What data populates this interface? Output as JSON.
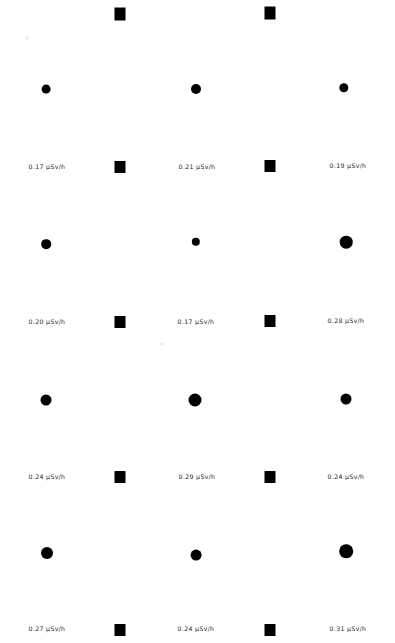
{
  "canvas": {
    "width": 395,
    "height": 643,
    "background": "#ffffff",
    "marker_color": "#000000",
    "label_color": "#1a1a1a"
  },
  "units": "µSv/h",
  "chart_data": {
    "type": "scatter",
    "title": "",
    "subtitle": "",
    "xlabel": "",
    "ylabel": "",
    "grid": false,
    "legend": null,
    "value_unit": "µSv/h",
    "marker_encoding": "circle area scales with dose rate value",
    "columns": [
      "left",
      "center",
      "right"
    ],
    "rows": [
      "row-1",
      "row-2",
      "row-3",
      "row-4",
      "row-5"
    ],
    "column_x": [
      46,
      196,
      346
    ],
    "points": [
      {
        "id": "p-r1-c1",
        "col": 0,
        "row": 0,
        "x": 46,
        "y": 89,
        "value": 0.17,
        "label": "0.17 µSv/h",
        "radius": 4.4
      },
      {
        "id": "p-r1-c2",
        "col": 1,
        "row": 0,
        "x": 196,
        "y": 89,
        "value": 0.21,
        "label": "0.21 µSv/h",
        "radius": 5.0
      },
      {
        "id": "p-r1-c3",
        "col": 2,
        "row": 0,
        "x": 344,
        "y": 88,
        "value": 0.19,
        "label": "0.19  µSv/h",
        "radius": 4.7
      },
      {
        "id": "p-r2-c1",
        "col": 0,
        "row": 1,
        "x": 46,
        "y": 244,
        "value": 0.2,
        "label": "0.20  µSv/h",
        "radius": 4.8
      },
      {
        "id": "p-r2-c2",
        "col": 1,
        "row": 1,
        "x": 196,
        "y": 242,
        "value": 0.17,
        "label": "0.17  µSv/h",
        "radius": 4.2
      },
      {
        "id": "p-r2-c3",
        "col": 2,
        "row": 1,
        "x": 346,
        "y": 242,
        "value": 0.28,
        "label": "0.28 µSv/h",
        "radius": 6.3
      },
      {
        "id": "p-r3-c1",
        "col": 0,
        "row": 2,
        "x": 46,
        "y": 400,
        "value": 0.24,
        "label": "0.24  µSv/h",
        "radius": 5.5
      },
      {
        "id": "p-r3-c2",
        "col": 1,
        "row": 2,
        "x": 195,
        "y": 400,
        "value": 0.29,
        "label": "0.29  µSv/h",
        "radius": 6.5
      },
      {
        "id": "p-r3-c3",
        "col": 2,
        "row": 2,
        "x": 346,
        "y": 399,
        "value": 0.24,
        "label": "0.24 µSv/h",
        "radius": 5.5
      },
      {
        "id": "p-r4-c1",
        "col": 0,
        "row": 3,
        "x": 47,
        "y": 553,
        "value": 0.27,
        "label": "0.27 µSv/h",
        "radius": 6.0
      },
      {
        "id": "p-r4-c2",
        "col": 1,
        "row": 3,
        "x": 196,
        "y": 555,
        "value": 0.24,
        "label": "0.24 µSv/h",
        "radius": 5.4
      },
      {
        "id": "p-r4-c3",
        "col": 2,
        "row": 3,
        "x": 346,
        "y": 551,
        "value": 0.31,
        "label": "0.31 µSv/h",
        "radius": 6.8
      }
    ],
    "labels": [
      {
        "id": "lbl-r1-c1",
        "text": "0.17 µSv/h",
        "x": 47,
        "y": 167
      },
      {
        "id": "lbl-r1-c2",
        "text": "0.21 µSv/h",
        "x": 197,
        "y": 167
      },
      {
        "id": "lbl-r1-c3",
        "text": "0.19  µSv/h",
        "x": 348,
        "y": 166
      },
      {
        "id": "lbl-r2-c1",
        "text": "0.20  µSv/h",
        "x": 47,
        "y": 322
      },
      {
        "id": "lbl-r2-c2",
        "text": "0.17  µSv/h",
        "x": 196,
        "y": 322
      },
      {
        "id": "lbl-r2-c3",
        "text": "0.28 µSv/h",
        "x": 346,
        "y": 321
      },
      {
        "id": "lbl-r3-c1",
        "text": "0.24  µSv/h",
        "x": 47,
        "y": 477
      },
      {
        "id": "lbl-r3-c2",
        "text": "0.29  µSv/h",
        "x": 197,
        "y": 477
      },
      {
        "id": "lbl-r3-c3",
        "text": "0.24 µSv/h",
        "x": 346,
        "y": 477
      },
      {
        "id": "lbl-r4-c1",
        "text": "0.27 µSv/h",
        "x": 47,
        "y": 629
      },
      {
        "id": "lbl-r4-c2",
        "text": "0.24 µSv/h",
        "x": 196,
        "y": 629
      },
      {
        "id": "lbl-r4-c3",
        "text": "0.31 µSv/h",
        "x": 348,
        "y": 629
      }
    ],
    "separators": [
      {
        "id": "sq-r0-a",
        "x": 120,
        "y": 14,
        "w": 11,
        "h": 13
      },
      {
        "id": "sq-r0-b",
        "x": 270,
        "y": 13,
        "w": 11,
        "h": 13
      },
      {
        "id": "sq-r1-a",
        "x": 120,
        "y": 167,
        "w": 11,
        "h": 12
      },
      {
        "id": "sq-r1-b",
        "x": 270,
        "y": 166,
        "w": 11,
        "h": 12
      },
      {
        "id": "sq-r2-a",
        "x": 120,
        "y": 322,
        "w": 11,
        "h": 12
      },
      {
        "id": "sq-r2-b",
        "x": 270,
        "y": 321,
        "w": 11,
        "h": 12
      },
      {
        "id": "sq-r3-a",
        "x": 120,
        "y": 477,
        "w": 11,
        "h": 12
      },
      {
        "id": "sq-r3-b",
        "x": 270,
        "y": 477,
        "w": 11,
        "h": 12
      },
      {
        "id": "sq-r4-a",
        "x": 120,
        "y": 630,
        "w": 11,
        "h": 12
      },
      {
        "id": "sq-r4-b",
        "x": 270,
        "y": 630,
        "w": 11,
        "h": 12
      }
    ],
    "specks": [
      {
        "id": "speck-1",
        "x": 27,
        "y": 38,
        "w": 3,
        "h": 3
      },
      {
        "id": "speck-2",
        "x": 161,
        "y": 344,
        "w": 3,
        "h": 2
      }
    ]
  }
}
